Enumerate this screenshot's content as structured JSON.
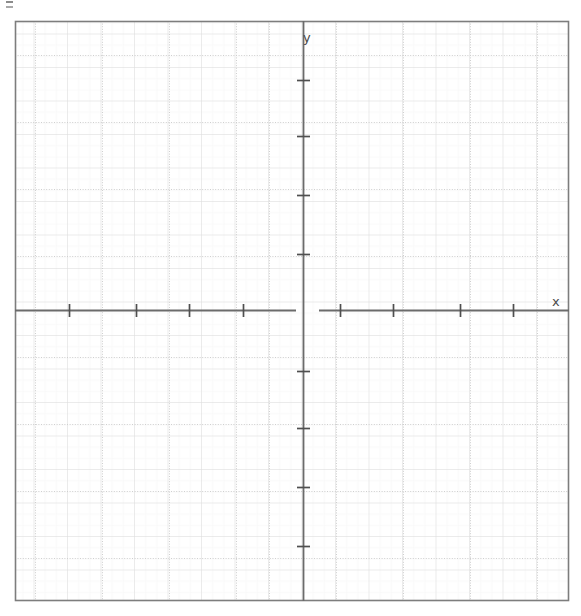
{
  "page": {
    "kind": "blank-cartesian-grid",
    "width": 581,
    "height": 616,
    "background_color": "#ffffff"
  },
  "artifact": {
    "name": "scan-artifact-mark",
    "x": 6,
    "y": 1
  },
  "axes": {
    "x_label": "x",
    "y_label": "y",
    "axis_color": "#6b6b6b",
    "frame_color": "#808080",
    "origin_x": 303,
    "origin_y": 310,
    "tick_spacing_px": 67,
    "tick_length_px": 11,
    "x_axis": {
      "label": "x",
      "label_x": 552,
      "label_y": 295,
      "left_end": 15,
      "right_end": 569,
      "gap_start": 296,
      "gap_end": 319,
      "ticks": [
        {
          "x": 69
        },
        {
          "x": 136
        },
        {
          "x": 189
        },
        {
          "x": 243
        },
        {
          "x": 340
        },
        {
          "x": 393
        },
        {
          "x": 460
        },
        {
          "x": 513
        }
      ]
    },
    "y_axis": {
      "label": "y",
      "label_x": 303,
      "label_y": 31,
      "top_end": 22,
      "bottom_end": 601,
      "ticks": [
        {
          "y": 80
        },
        {
          "y": 136
        },
        {
          "y": 195
        },
        {
          "y": 254
        },
        {
          "y": 371
        },
        {
          "y": 428
        },
        {
          "y": 487
        },
        {
          "y": 546
        }
      ]
    }
  },
  "frame": {
    "left": 15,
    "top": 21,
    "right": 569,
    "bottom": 601,
    "stroke_width": 1.6,
    "color": "#7d7d7d"
  },
  "grid": {
    "minor_spacing_px": 11.2,
    "major_spacing_px": 33.5,
    "minor_color": "#f2f2f2",
    "major_color": "#d8d8d8",
    "dotted_color": "#d0d0d0",
    "show_minor": true,
    "show_major": true
  },
  "chart_data": {
    "type": "line",
    "title": "",
    "subtitle": "",
    "xlabel": "x",
    "ylabel": "y",
    "series": [],
    "categories": [],
    "values": [],
    "xlim": [
      -4.3,
      4.0
    ],
    "ylim": [
      -4.3,
      4.3
    ],
    "grid": true,
    "legend": "none",
    "annotations": []
  }
}
